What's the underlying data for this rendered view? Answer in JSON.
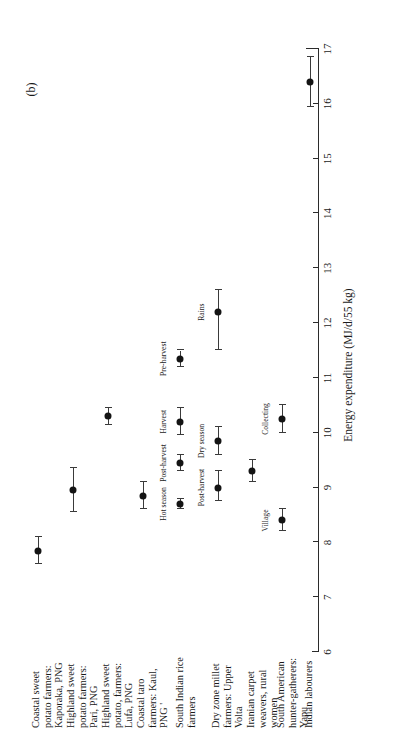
{
  "panel": {
    "tag": "(b)"
  },
  "axis": {
    "title": "Energy expenditure (MJ/d/55 kg)",
    "ticks": [
      6,
      7,
      8,
      9,
      10,
      11,
      12,
      13,
      14,
      15,
      16,
      17
    ],
    "min": 6,
    "max": 17
  },
  "chart_data": {
    "type": "scatter",
    "title": "",
    "subtitle": "",
    "xlabel": "Energy expenditure (MJ/d/55 kg)",
    "ylabel": "",
    "xlim": [
      6,
      17
    ],
    "grid": false,
    "legend": "none",
    "orientation": "horizontal-dot-plot-with-error-bars",
    "categories": [
      "Coastal sweet potato farmers: Kaporaka, PNG",
      "Highland sweet potato farmers: Pari, PNG",
      "Highland sweet potato, farmers: Lufa, PNG",
      "Coastal taro farmers: Kaul, PNG '",
      "South Indian rice farmers",
      "Dry zone millet farmers: Upper Volta",
      "Iranian carpet weavers, rural women",
      "South American hunter-gatherers: Yapu",
      "Indian labourers"
    ],
    "points": [
      {
        "category": "Coastal sweet potato farmers: Kaporaka, PNG",
        "annotation": "",
        "value": 7.85,
        "low": 7.6,
        "high": 8.1
      },
      {
        "category": "Highland sweet potato farmers: Pari, PNG",
        "annotation": "",
        "value": 8.95,
        "low": 8.55,
        "high": 9.35
      },
      {
        "category": "Highland sweet potato, farmers: Lufa, PNG",
        "annotation": "",
        "value": 10.3,
        "low": 10.15,
        "high": 10.45
      },
      {
        "category": "Coastal taro farmers: Kaul, PNG '",
        "annotation": "",
        "value": 8.85,
        "low": 8.6,
        "high": 9.1
      },
      {
        "category": "South Indian rice farmers",
        "annotation": "Hot season",
        "value": 8.7,
        "low": 8.6,
        "high": 8.8
      },
      {
        "category": "South Indian rice farmers",
        "annotation": "Post-harvest",
        "value": 9.45,
        "low": 9.3,
        "high": 9.6
      },
      {
        "category": "South Indian rice farmers",
        "annotation": "Harvest",
        "value": 10.2,
        "low": 9.95,
        "high": 10.45
      },
      {
        "category": "South Indian rice farmers",
        "annotation": "Pre-harvest",
        "value": 11.35,
        "low": 11.2,
        "high": 11.5
      },
      {
        "category": "Dry zone millet farmers: Upper Volta",
        "annotation": "Post-harvest",
        "value": 9.0,
        "low": 8.75,
        "high": 9.3
      },
      {
        "category": "Dry zone millet farmers: Upper Volta",
        "annotation": "Dry season",
        "value": 9.85,
        "low": 9.6,
        "high": 10.1
      },
      {
        "category": "Dry zone millet farmers: Upper Volta",
        "annotation": "Rains",
        "value": 12.2,
        "low": 11.5,
        "high": 12.6
      },
      {
        "category": "Iranian carpet weavers, rural women",
        "annotation": "",
        "value": 9.3,
        "low": 9.1,
        "high": 9.5
      },
      {
        "category": "South American hunter-gatherers: Yapu",
        "annotation": "Village",
        "value": 8.4,
        "low": 8.2,
        "high": 8.6
      },
      {
        "category": "South American hunter-gatherers: Yapu",
        "annotation": "Collecting",
        "value": 10.25,
        "low": 10.0,
        "high": 10.5
      },
      {
        "category": "Indian labourers",
        "annotation": "",
        "value": 16.4,
        "low": 15.95,
        "high": 16.85
      }
    ]
  }
}
